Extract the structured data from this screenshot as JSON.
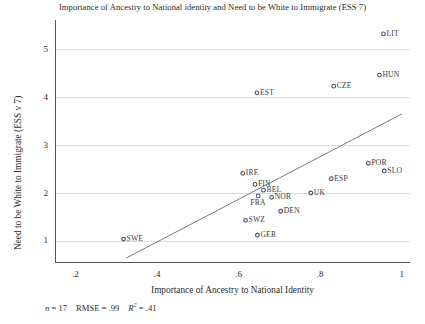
{
  "chart_data": {
    "type": "scatter",
    "title": "Importance of Ancestry to National identity and Need to be White to Immigrate (ESS 7)",
    "xlabel": "Importance of Ancestry to National Identity",
    "ylabel": "Need to be White to Immigrate (ESS v 7)",
    "xlim": [
      0.15,
      1.02
    ],
    "ylim": [
      0.55,
      5.62
    ],
    "xticks": [
      ".2",
      ".4",
      ".6",
      ".8",
      "1"
    ],
    "xtick_values": [
      0.2,
      0.4,
      0.6,
      0.8,
      1.0
    ],
    "yticks": [
      "1",
      "2",
      "3",
      "4",
      "5"
    ],
    "ytick_values": [
      1,
      2,
      3,
      4,
      5
    ],
    "grid": "horizontal",
    "legend": "none",
    "marker": "open-circle",
    "points": [
      {
        "label": "LIT",
        "x": 0.955,
        "y": 5.33,
        "label_pos": "right"
      },
      {
        "label": "HUN",
        "x": 0.945,
        "y": 4.47,
        "label_pos": "right"
      },
      {
        "label": "CZE",
        "x": 0.833,
        "y": 4.24,
        "label_pos": "right"
      },
      {
        "label": "EST",
        "x": 0.645,
        "y": 4.1,
        "label_pos": "right"
      },
      {
        "label": "POR",
        "x": 0.918,
        "y": 2.63,
        "label_pos": "right"
      },
      {
        "label": "SLO",
        "x": 0.957,
        "y": 2.47,
        "label_pos": "right"
      },
      {
        "label": "IRE",
        "x": 0.61,
        "y": 2.42,
        "label_pos": "right"
      },
      {
        "label": "ESP",
        "x": 0.827,
        "y": 2.31,
        "label_pos": "right"
      },
      {
        "label": "FIN",
        "x": 0.64,
        "y": 2.19,
        "label_pos": "right"
      },
      {
        "label": "BEL",
        "x": 0.661,
        "y": 2.07,
        "label_pos": "right"
      },
      {
        "label": "UK",
        "x": 0.777,
        "y": 2.01,
        "label_pos": "right"
      },
      {
        "label": "FRA",
        "x": 0.648,
        "y": 1.95,
        "label_pos": "below"
      },
      {
        "label": "NOR",
        "x": 0.681,
        "y": 1.92,
        "label_pos": "right"
      },
      {
        "label": "DEN",
        "x": 0.703,
        "y": 1.63,
        "label_pos": "right"
      },
      {
        "label": "SWZ",
        "x": 0.617,
        "y": 1.44,
        "label_pos": "right"
      },
      {
        "label": "GER",
        "x": 0.646,
        "y": 1.13,
        "label_pos": "right"
      },
      {
        "label": "SWE",
        "x": 0.318,
        "y": 1.05,
        "label_pos": "right"
      }
    ],
    "fit_line": {
      "x_start": 0.325,
      "y_start": 0.655,
      "x_end": 1.0,
      "y_end": 3.66
    },
    "annotations": {
      "n_label": "n",
      "n_value": "= 17",
      "rmse_label": "RMSE",
      "rmse_value": "= .99",
      "r2_label": "R",
      "r2_exponent": "2",
      "r2_value": "= .41"
    },
    "colors": {
      "marker_stroke": "#4a4a6a",
      "line": "#6a6a7a",
      "grid": "#c9c9c9",
      "axis": "#555555",
      "text": "#2b2b2b"
    }
  }
}
